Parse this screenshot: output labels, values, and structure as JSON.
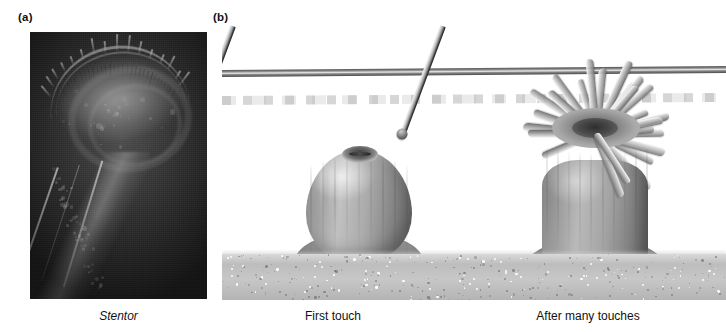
{
  "figure": {
    "panel_a": {
      "label": "(a)",
      "caption": "Stentor"
    },
    "panel_b": {
      "label": "(b)",
      "left_caption": "First touch",
      "right_caption": "After many touches"
    }
  },
  "colors": {
    "background": "#ffffff",
    "text": "#111111",
    "micrograph_bg": "#2b2b2b",
    "water_line": "#5d5d5d",
    "substrate": "#c2c2c2",
    "anemone_body": "#a6a6a6",
    "tentacle": "#d2d2d2",
    "probe_shaft": "#9b9b9b",
    "probe_ball": "#5a5a5a"
  },
  "chart_data": {
    "type": "table",
    "categories": [
      "First touch",
      "After many touches"
    ],
    "series": [
      {
        "name": "Response state",
        "values": [
          "contracted / withdrawn",
          "expanded / tentacles extended"
        ]
      },
      {
        "name": "Tentacles visible",
        "values": [
          0,
          22
        ]
      }
    ],
    "annotations": [
      "Stentor",
      "(a)",
      "(b)"
    ]
  }
}
